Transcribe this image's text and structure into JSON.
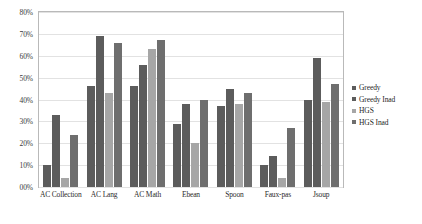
{
  "chart_data": {
    "type": "bar",
    "title": "",
    "subtitle": "",
    "xlabel": "",
    "ylabel": "",
    "ylim": [
      0,
      80
    ],
    "grid": true,
    "legend_position": "right",
    "ytick_labels": [
      "80%",
      "70%",
      "60%",
      "50%",
      "40%",
      "30%",
      "20%",
      "10%",
      "00%"
    ],
    "ytick_values": [
      80,
      70,
      60,
      50,
      40,
      30,
      20,
      10,
      0
    ],
    "categories": [
      "AC Collection",
      "AC Lang",
      "AC Math",
      "Ebean",
      "Spoon",
      "Faux-pas",
      "Jsoup"
    ],
    "series": [
      {
        "name": "Greedy",
        "color": "#5c5c5c",
        "values": [
          10,
          46,
          46,
          29,
          37,
          10,
          40
        ]
      },
      {
        "name": "Greedy Inad",
        "color": "#5c5c5c",
        "values": [
          33,
          69,
          56,
          38,
          45,
          14,
          59
        ]
      },
      {
        "name": "HGS",
        "color": "#a6a6a6",
        "values": [
          4,
          43,
          63,
          20,
          38,
          4,
          39
        ]
      },
      {
        "name": "HGS Inad",
        "color": "#6e6e6e",
        "values": [
          24,
          66,
          67,
          40,
          43,
          27,
          47
        ]
      }
    ]
  }
}
